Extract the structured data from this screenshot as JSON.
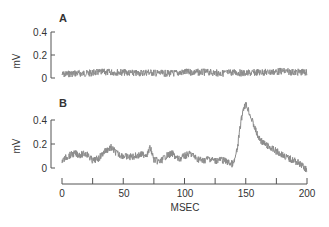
{
  "chart_data": [
    {
      "type": "line",
      "panel_label": "A",
      "title": "",
      "xlabel": "",
      "ylabel": "mV",
      "ylim": [
        0,
        0.4
      ],
      "yticks": [
        0,
        0.2,
        0.4
      ],
      "ytick_labels": [
        "0",
        "0.2",
        "0.4"
      ],
      "xlim": [
        0,
        200
      ],
      "grid": false,
      "legend": null,
      "series": [
        {
          "name": "trace A",
          "x": [
            0,
            10,
            20,
            30,
            40,
            50,
            60,
            70,
            80,
            90,
            100,
            110,
            120,
            130,
            140,
            150,
            160,
            170,
            180,
            190,
            200
          ],
          "values": [
            0.03,
            0.04,
            0.04,
            0.05,
            0.05,
            0.05,
            0.04,
            0.05,
            0.04,
            0.04,
            0.05,
            0.05,
            0.05,
            0.04,
            0.05,
            0.04,
            0.05,
            0.05,
            0.06,
            0.05,
            0.05
          ]
        }
      ]
    },
    {
      "type": "line",
      "panel_label": "B",
      "title": "",
      "xlabel": "MSEC",
      "ylabel": "mV",
      "ylim": [
        0,
        0.4
      ],
      "yticks": [
        0,
        0.2,
        0.4
      ],
      "ytick_labels": [
        "0",
        "0.2",
        "0.4"
      ],
      "xlim": [
        0,
        200
      ],
      "xticks": [
        0,
        25,
        50,
        75,
        100,
        125,
        150,
        175,
        200
      ],
      "xtick_labels": [
        "0",
        "",
        "50",
        "",
        "100",
        "",
        "150",
        "",
        "200"
      ],
      "grid": false,
      "legend": null,
      "series": [
        {
          "name": "trace B",
          "x": [
            0,
            5,
            10,
            15,
            20,
            25,
            30,
            35,
            40,
            45,
            50,
            55,
            60,
            65,
            70,
            72,
            75,
            80,
            85,
            90,
            95,
            100,
            105,
            110,
            115,
            120,
            125,
            130,
            135,
            140,
            143,
            146,
            148,
            150,
            152,
            155,
            160,
            165,
            170,
            175,
            180,
            185,
            190,
            195,
            200
          ],
          "values": [
            0.06,
            0.1,
            0.12,
            0.11,
            0.12,
            0.06,
            0.08,
            0.14,
            0.17,
            0.12,
            0.1,
            0.09,
            0.1,
            0.11,
            0.12,
            0.17,
            0.07,
            0.05,
            0.1,
            0.12,
            0.07,
            0.1,
            0.12,
            0.08,
            0.06,
            0.08,
            0.06,
            0.07,
            0.05,
            0.03,
            0.15,
            0.38,
            0.5,
            0.53,
            0.49,
            0.4,
            0.26,
            0.2,
            0.17,
            0.14,
            0.11,
            0.08,
            0.06,
            0.03,
            -0.02
          ]
        }
      ]
    }
  ],
  "panels": {
    "a": {
      "label": "A",
      "ylabel": "mV",
      "ticks": [
        "0.4",
        "0.2",
        "0"
      ]
    },
    "b": {
      "label": "B",
      "ylabel": "mV",
      "ticks": [
        "0.4",
        "0.2",
        "0"
      ]
    }
  },
  "xaxis": {
    "label": "MSEC",
    "tick_labels": [
      "0",
      "50",
      "100",
      "150",
      "200"
    ]
  },
  "colors": {
    "trace": "#8c8c8c",
    "axis": "#555555",
    "text": "#333333"
  }
}
